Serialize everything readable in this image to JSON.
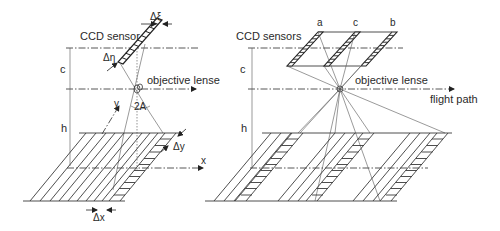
{
  "figure": {
    "left_panel": {
      "title": "CCD sensor",
      "labels": {
        "delta_xi": "Δξ",
        "delta_eta": "Δη",
        "objective_lense": "objective lense",
        "angle": "2A",
        "y_axis": "y",
        "x_axis": "x",
        "delta_y": "Δy",
        "delta_x": "Δx",
        "c": "c",
        "h": "h"
      }
    },
    "right_panel": {
      "title": "CCD sensors",
      "labels": {
        "sensor_a": "a",
        "sensor_c": "c",
        "sensor_b": "b",
        "objective_lense": "objective lense",
        "flight_path": "flight path",
        "c": "c",
        "h": "h"
      }
    },
    "colors": {
      "line": "#3a3a3a",
      "text": "#2a2a2a",
      "background": "#ffffff"
    }
  }
}
